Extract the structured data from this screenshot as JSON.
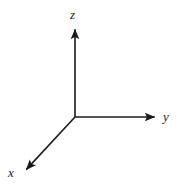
{
  "figure": {
    "name": "3d-cartesian-axes",
    "background_color": "#ffffff",
    "line_color": "#1a1a1a",
    "line_width": 1.6,
    "width": 178,
    "height": 186
  },
  "chart_data": {
    "type": "diagram",
    "title": "",
    "subtitle": "",
    "xlabel": "",
    "ylabel": "",
    "grid": false,
    "legend": false,
    "origin": {
      "x": 75,
      "y": 117
    },
    "axes": [
      {
        "id": "x-axis",
        "label": "x",
        "direction": "down-left",
        "from": {
          "x": 75,
          "y": 117
        },
        "to": {
          "x": 24,
          "y": 172
        },
        "arrowhead": true,
        "label_position": {
          "x": 8,
          "y": 166
        }
      },
      {
        "id": "y-axis",
        "label": "y",
        "direction": "right",
        "from": {
          "x": 75,
          "y": 117
        },
        "to": {
          "x": 158,
          "y": 117
        },
        "arrowhead": true,
        "label_position": {
          "x": 163,
          "y": 110
        }
      },
      {
        "id": "z-axis",
        "label": "z",
        "direction": "up",
        "from": {
          "x": 75,
          "y": 117
        },
        "to": {
          "x": 75,
          "y": 26
        },
        "arrowhead": true,
        "label_position": {
          "x": 70,
          "y": 8
        }
      }
    ],
    "labels": {
      "x": "x",
      "y": "y",
      "z": "z"
    }
  }
}
